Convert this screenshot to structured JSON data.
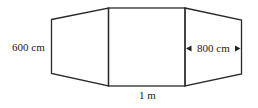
{
  "figure": {
    "labels": {
      "left_height": "600 cm",
      "right_width": "800 cm",
      "bottom_width": "1 m"
    },
    "colors": {
      "stroke": "#2a2a2a",
      "text": "#222222",
      "background": "#ffffff"
    }
  }
}
